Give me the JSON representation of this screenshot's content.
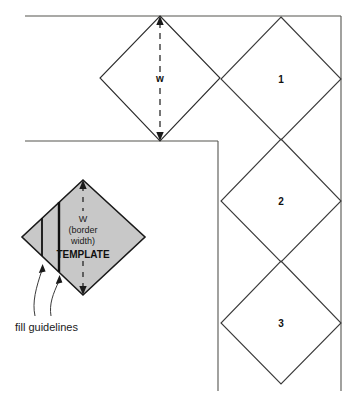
{
  "figure": {
    "type": "technical-illustration",
    "background_color": "#ffffff",
    "line_color": "#4a4a4a",
    "dark_line_color": "#1a1a1a",
    "template_fill_color": "#c8c8c8",
    "text_color": "#1a1a1a"
  },
  "border_guides": {
    "outer_top_line": "outer border edge",
    "inner_top_line": "inner border edge",
    "inner_vertical_line": "inner border edge",
    "outer_vertical_line": "outer border edge"
  },
  "dimension": {
    "label": "w",
    "description": "border width dimension arrow on corner tile"
  },
  "tiles": [
    {
      "number": "1"
    },
    {
      "number": "2"
    },
    {
      "number": "3"
    }
  ],
  "corner_tile": {
    "name": "corner-tile",
    "number": ""
  },
  "template": {
    "line1": "W",
    "line2": "(border",
    "line3": "width)",
    "line4": "TEMPLATE",
    "fill": "#c8c8c8"
  },
  "guidelines": {
    "caption": "fill guidelines",
    "count": 2
  }
}
